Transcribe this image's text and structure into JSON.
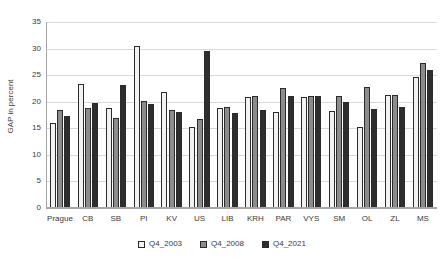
{
  "chart_data": {
    "type": "bar",
    "title": "",
    "xlabel": "",
    "ylabel": "GAP in percent",
    "ylim": [
      0,
      35
    ],
    "yticks": [
      0,
      5,
      10,
      15,
      20,
      25,
      30,
      35
    ],
    "grid": true,
    "legend_position": "bottom",
    "categories": [
      "Prague",
      "CB",
      "SB",
      "PI",
      "KV",
      "US",
      "LIB",
      "KRH",
      "PAR",
      "VYS",
      "SM",
      "OL",
      "ZL",
      "MS"
    ],
    "series": [
      {
        "name": "Q4_2003",
        "color": "#f2f2f2",
        "values": [
          16.0,
          23.3,
          18.8,
          30.4,
          21.9,
          15.3,
          18.9,
          20.8,
          18.0,
          20.8,
          18.3,
          15.3,
          21.2,
          24.6
        ]
      },
      {
        "name": "Q4_2008",
        "color": "#8c8c8c",
        "values": [
          18.4,
          18.8,
          17.0,
          20.2,
          18.5,
          16.8,
          19.0,
          21.0,
          22.5,
          21.0,
          21.0,
          22.8,
          21.3,
          27.3
        ]
      },
      {
        "name": "Q4_2021",
        "color": "#2e2e2e",
        "values": [
          17.4,
          19.8,
          23.1,
          19.5,
          18.0,
          29.5,
          17.8,
          18.4,
          21.0,
          21.0,
          20.0,
          18.6,
          19.0,
          26.0
        ]
      }
    ]
  },
  "axis": {
    "y_title": "GAP in percent"
  },
  "legend": {
    "items": [
      {
        "label": "Q4_2003"
      },
      {
        "label": "Q4_2008"
      },
      {
        "label": "Q4_2021"
      }
    ]
  }
}
